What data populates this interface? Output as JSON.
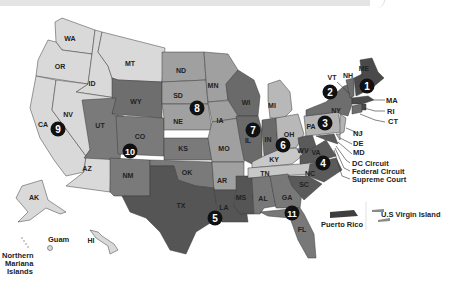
{
  "map": {
    "title": "U.S. Federal Judicial Circuits",
    "colors": {
      "c1": "#4a4a4a",
      "c2": "#6e6e6e",
      "c3": "#b4b4b4",
      "c4": "#5a5a5a",
      "c5": "#555555",
      "c6": "#8a8a8a",
      "c7": "#6a6a6a",
      "c8": "#a0a0a0",
      "c9": "#d9d9d9",
      "c10": "#7a7a7a",
      "c11": "#787878",
      "outline": "#3a3a3a",
      "badge": "#111111"
    },
    "states": {
      "WA": "WA",
      "OR": "OR",
      "ID": "ID",
      "MT": "MT",
      "CA": "CA",
      "NV": "NV",
      "AZ": "AZ",
      "AK": "AK",
      "HI": "HI",
      "WY": "WY",
      "UT": "UT",
      "CO": "CO",
      "NM": "NM",
      "KS": "KS",
      "OK": "OK",
      "ND": "ND",
      "SD": "SD",
      "NE": "NE",
      "MN": "MN",
      "IA": "IA",
      "MO": "MO",
      "AR": "AR",
      "TX": "TX",
      "LA": "LA",
      "MS": "MS",
      "WI": "WI",
      "IL": "IL",
      "IN": "IN",
      "MI": "MI",
      "OH": "OH",
      "KY": "KY",
      "TN": "TN",
      "WV": "WV",
      "VA": "VA",
      "NC": "NC",
      "SC": "SC",
      "AL": "AL",
      "GA": "GA",
      "FL": "FL",
      "PA": "PA",
      "NY": "NY",
      "VT": "VT",
      "NH": "NH",
      "ME": "ME",
      "MA": "MA",
      "RI": "RI",
      "CT": "CT",
      "NJ": "NJ",
      "DE": "DE",
      "MD": "MD"
    },
    "circuits": [
      "1",
      "2",
      "3",
      "4",
      "5",
      "6",
      "7",
      "8",
      "9",
      "10",
      "11"
    ],
    "callouts": {
      "dc": "DC Circuit",
      "federal": "Federal Circuit",
      "supreme": "Supreme Court"
    },
    "territories": {
      "guam": "Guam",
      "nmi_1": "Northern",
      "nmi_2": "Mariana",
      "nmi_3": "Islands",
      "pr": "Puerto Rico",
      "vi": "U.S Virgin Island"
    }
  }
}
